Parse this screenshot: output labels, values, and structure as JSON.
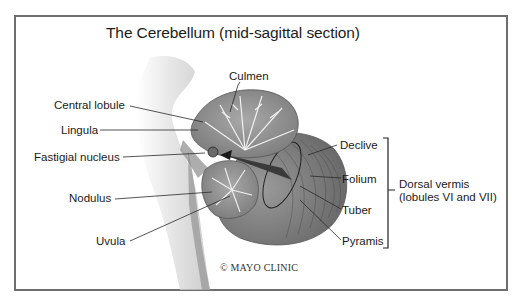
{
  "diagram": {
    "title": "The Cerebellum (mid-sagittal section)",
    "copyright": "© MAYO CLINIC",
    "labels": {
      "culmen": "Culmen",
      "central_lobule": "Central lobule",
      "lingula": "Lingula",
      "fastigial_nucleus": "Fastigial nucleus",
      "nodulus": "Nodulus",
      "uvula": "Uvula",
      "declive": "Declive",
      "folium": "Folium",
      "tuber": "Tuber",
      "pyramis": "Pyramis"
    },
    "bracket_group": {
      "line1": "Dorsal vermis",
      "line2": "(lobules VI and VII)"
    },
    "colors": {
      "frame": "#6e6e6e",
      "tissue_light": "#b8b8b8",
      "tissue_dark": "#6a6a6a",
      "white_matter": "#e8e8e8",
      "leader_lines": "#2a2a2a"
    }
  }
}
